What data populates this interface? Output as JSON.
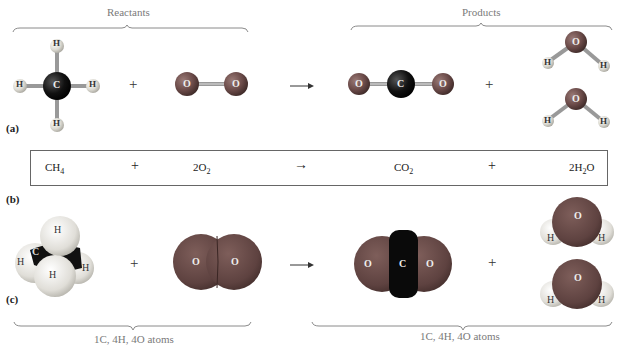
{
  "figure": {
    "header": {
      "reactants_label": "Reactants",
      "products_label": "Products"
    },
    "panels": {
      "a": {
        "label": "(a)",
        "style": "ball-and-stick"
      },
      "b": {
        "label": "(b)",
        "style": "chemical-equation"
      },
      "c": {
        "label": "(c)",
        "style": "space-filling"
      }
    },
    "equation": {
      "reactant1": "CH",
      "reactant1_sub": "4",
      "plus1": "+",
      "reactant2_coef": "2O",
      "reactant2_sub": "2",
      "arrow": "→",
      "product1": "CO",
      "product1_sub": "2",
      "plus2": "+",
      "product2_coef": "2H",
      "product2_sub": "2",
      "product2_tail": "O"
    },
    "plus_sign": "+",
    "atoms": {
      "C": "C",
      "H": "H",
      "O": "O"
    },
    "footer": {
      "reactant_atoms": "1C, 4H, 4O atoms",
      "product_atoms": "1C, 4H, 4O atoms"
    },
    "colors": {
      "carbon": "#0e0e0e",
      "oxygen": "#6a4a48",
      "hydrogen": "#e2e0da",
      "bond": "#9a9a9a",
      "bracket": "#8a8a8a",
      "box_border": "#666666"
    }
  }
}
